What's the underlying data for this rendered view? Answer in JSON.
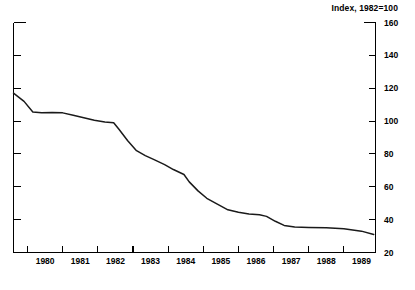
{
  "chart_data": {
    "type": "line",
    "title": "Index, 1982=100",
    "xlabel": "",
    "ylabel": "",
    "ylim": [
      20,
      160
    ],
    "xlim": [
      1979.6,
      1989.9
    ],
    "grid": false,
    "legend": "none",
    "y_ticks": [
      160,
      140,
      120,
      100,
      80,
      60,
      40,
      20
    ],
    "x_ticks": [
      1980,
      1981,
      1982,
      1983,
      1984,
      1985,
      1986,
      1987,
      1988,
      1989
    ],
    "axis_side": "right",
    "series": [
      {
        "name": "Index",
        "x": [
          1979.6,
          1979.9,
          1980.15,
          1980.4,
          1980.7,
          1981.0,
          1981.3,
          1981.6,
          1981.9,
          1982.2,
          1982.45,
          1982.6,
          1982.85,
          1983.1,
          1983.35,
          1983.6,
          1983.9,
          1984.15,
          1984.45,
          1984.6,
          1984.85,
          1985.1,
          1985.4,
          1985.7,
          1986.0,
          1986.3,
          1986.6,
          1986.8,
          1987.05,
          1987.3,
          1987.6,
          1988.0,
          1988.5,
          1989.0,
          1989.5,
          1989.85
        ],
        "values": [
          117.0,
          112.0,
          105.5,
          105.0,
          105.2,
          105.0,
          103.5,
          102.0,
          100.5,
          99.5,
          99.0,
          95.0,
          88.0,
          82.0,
          79.0,
          76.5,
          73.5,
          70.5,
          67.5,
          63.0,
          57.5,
          53.0,
          49.5,
          46.0,
          44.5,
          43.5,
          43.0,
          42.0,
          39.0,
          36.5,
          35.5,
          35.2,
          35.0,
          34.5,
          33.0,
          31.0
        ]
      }
    ]
  },
  "bleed_text": ""
}
